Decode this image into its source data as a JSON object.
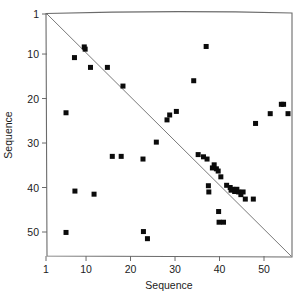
{
  "chart_data": {
    "type": "scatter",
    "title": "",
    "xlabel": "Sequence",
    "ylabel": "Sequence",
    "xlim": [
      1,
      56
    ],
    "ylim": [
      1,
      53
    ],
    "y_axis_inverted": true,
    "grid": false,
    "legend": null,
    "xticks": [
      1,
      10,
      20,
      30,
      40,
      50
    ],
    "yticks": [
      1,
      10,
      20,
      30,
      40,
      50
    ],
    "xtick_labels": [
      "1",
      "10",
      "20",
      "30",
      "40",
      "50"
    ],
    "ytick_labels": [
      "1",
      "10",
      "20",
      "30",
      "40",
      "50"
    ],
    "marker": "square",
    "marker_color": "#0b0b0b",
    "annotations": [
      {
        "name": "anti-diagonal-reference-line",
        "type": "line",
        "from": [
          1,
          1
        ],
        "to": [
          56,
          53
        ],
        "color": "#7a7a7a"
      }
    ],
    "points": [
      {
        "x": 5.5,
        "y": 23.2
      },
      {
        "x": 5.5,
        "y": 50.1
      },
      {
        "x": 7.4,
        "y": 10.8
      },
      {
        "x": 7.5,
        "y": 40.8
      },
      {
        "x": 9.6,
        "y": 8.4
      },
      {
        "x": 9.8,
        "y": 8.9
      },
      {
        "x": 11.0,
        "y": 13.0
      },
      {
        "x": 11.8,
        "y": 41.5
      },
      {
        "x": 14.8,
        "y": 13.0
      },
      {
        "x": 15.9,
        "y": 33.0
      },
      {
        "x": 17.9,
        "y": 33.0
      },
      {
        "x": 18.3,
        "y": 17.2
      },
      {
        "x": 22.8,
        "y": 33.6
      },
      {
        "x": 22.9,
        "y": 49.9
      },
      {
        "x": 23.8,
        "y": 51.5
      },
      {
        "x": 25.8,
        "y": 29.8
      },
      {
        "x": 28.2,
        "y": 24.8
      },
      {
        "x": 28.8,
        "y": 23.7
      },
      {
        "x": 30.3,
        "y": 22.9
      },
      {
        "x": 34.2,
        "y": 16.0
      },
      {
        "x": 35.2,
        "y": 32.6
      },
      {
        "x": 36.4,
        "y": 33.1
      },
      {
        "x": 37.0,
        "y": 8.3
      },
      {
        "x": 37.2,
        "y": 33.6
      },
      {
        "x": 37.5,
        "y": 39.6
      },
      {
        "x": 37.6,
        "y": 41.0
      },
      {
        "x": 38.4,
        "y": 35.6
      },
      {
        "x": 38.8,
        "y": 34.9
      },
      {
        "x": 39.3,
        "y": 35.8
      },
      {
        "x": 39.7,
        "y": 36.3
      },
      {
        "x": 39.8,
        "y": 45.4
      },
      {
        "x": 39.9,
        "y": 47.8
      },
      {
        "x": 40.3,
        "y": 37.6
      },
      {
        "x": 40.9,
        "y": 47.8
      },
      {
        "x": 41.6,
        "y": 39.5
      },
      {
        "x": 42.4,
        "y": 40.0
      },
      {
        "x": 42.6,
        "y": 40.6
      },
      {
        "x": 43.0,
        "y": 40.4
      },
      {
        "x": 43.4,
        "y": 40.9
      },
      {
        "x": 43.9,
        "y": 40.4
      },
      {
        "x": 44.3,
        "y": 41.0
      },
      {
        "x": 44.8,
        "y": 41.6
      },
      {
        "x": 45.3,
        "y": 41.0
      },
      {
        "x": 45.8,
        "y": 42.6
      },
      {
        "x": 47.6,
        "y": 42.6
      },
      {
        "x": 48.1,
        "y": 25.6
      },
      {
        "x": 51.4,
        "y": 23.4
      },
      {
        "x": 53.9,
        "y": 21.3
      },
      {
        "x": 54.4,
        "y": 21.3
      },
      {
        "x": 55.4,
        "y": 23.4
      }
    ]
  }
}
